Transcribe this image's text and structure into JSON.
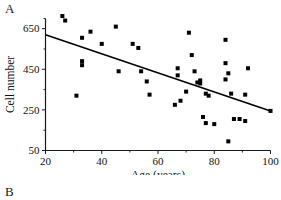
{
  "figure": {
    "panel_a_letter": "A",
    "panel_b_letter": "B"
  },
  "chart_data": {
    "type": "scatter",
    "title": "",
    "xlabel": "Age (years)",
    "ylabel": "Cell number",
    "xlim": [
      20,
      100
    ],
    "ylim": [
      50,
      700
    ],
    "xticks": [
      20,
      40,
      60,
      80,
      100
    ],
    "yticks": [
      50,
      250,
      450,
      650
    ],
    "xtick_labels": [
      "20",
      "40",
      "60",
      "80",
      "100"
    ],
    "ytick_labels": [
      "50",
      "250",
      "450",
      "650"
    ],
    "minor_xticks": [
      30,
      50,
      70,
      90
    ],
    "minor_yticks": [
      150,
      350,
      550,
      700
    ],
    "grid": false,
    "legend": null,
    "marker": "filled-square",
    "marker_color": "#000000",
    "points": [
      {
        "x": 26,
        "y": 712
      },
      {
        "x": 27,
        "y": 690
      },
      {
        "x": 31,
        "y": 320
      },
      {
        "x": 33,
        "y": 605
      },
      {
        "x": 33,
        "y": 490
      },
      {
        "x": 33,
        "y": 470
      },
      {
        "x": 36,
        "y": 635
      },
      {
        "x": 40,
        "y": 575
      },
      {
        "x": 45,
        "y": 660
      },
      {
        "x": 46,
        "y": 440
      },
      {
        "x": 51,
        "y": 575
      },
      {
        "x": 53,
        "y": 555
      },
      {
        "x": 54,
        "y": 440
      },
      {
        "x": 56,
        "y": 390
      },
      {
        "x": 57,
        "y": 325
      },
      {
        "x": 66,
        "y": 275
      },
      {
        "x": 67,
        "y": 455
      },
      {
        "x": 67,
        "y": 420
      },
      {
        "x": 68,
        "y": 295
      },
      {
        "x": 70,
        "y": 340
      },
      {
        "x": 71,
        "y": 630
      },
      {
        "x": 72,
        "y": 520
      },
      {
        "x": 73,
        "y": 440
      },
      {
        "x": 74,
        "y": 385
      },
      {
        "x": 75,
        "y": 395
      },
      {
        "x": 75,
        "y": 380
      },
      {
        "x": 76,
        "y": 215
      },
      {
        "x": 77,
        "y": 185
      },
      {
        "x": 77,
        "y": 330
      },
      {
        "x": 78,
        "y": 320
      },
      {
        "x": 80,
        "y": 180
      },
      {
        "x": 84,
        "y": 595
      },
      {
        "x": 84,
        "y": 480
      },
      {
        "x": 84,
        "y": 400
      },
      {
        "x": 85,
        "y": 430
      },
      {
        "x": 85,
        "y": 95
      },
      {
        "x": 86,
        "y": 330
      },
      {
        "x": 87,
        "y": 205
      },
      {
        "x": 89,
        "y": 205
      },
      {
        "x": 91,
        "y": 195
      },
      {
        "x": 91,
        "y": 325
      },
      {
        "x": 92,
        "y": 455
      },
      {
        "x": 100,
        "y": 245
      }
    ],
    "trendline": {
      "type": "linear-fit",
      "x_start": 20,
      "y_start": 620,
      "x_end": 100,
      "y_end": 245
    }
  }
}
